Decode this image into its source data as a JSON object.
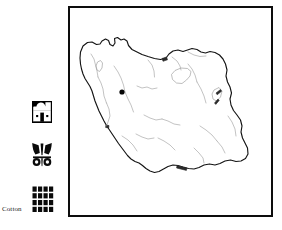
{
  "figure": {
    "kind": "archaeological-site-distribution-map",
    "region": "Iran"
  },
  "legend": {
    "entries": [
      {
        "icon": "building-pictogram-icon",
        "label": ""
      },
      {
        "icon": "emblem-pictogram-icon",
        "label": ""
      },
      {
        "icon": "cotton-weave-grid-icon",
        "label": "Cotton"
      }
    ]
  },
  "map": {
    "title": "",
    "outline_country": "Iran",
    "border_color": "#0d0d0d",
    "coastline_color": "#141414",
    "river_color": "#9a9a9a",
    "background_color": "#ffffff",
    "markers": [
      {
        "name": "site-marker",
        "color": "#050505",
        "x": 52,
        "y": 84
      }
    ]
  }
}
